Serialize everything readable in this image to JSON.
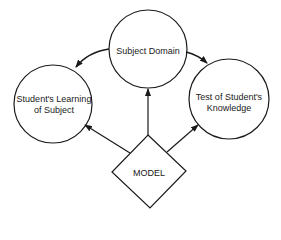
{
  "diagram": {
    "nodes": [
      {
        "id": "subject-domain",
        "shape": "circle",
        "label": "Subject Domain",
        "cx": 148,
        "cy": 49,
        "r": 39
      },
      {
        "id": "students-learning",
        "shape": "circle",
        "label_line1": "Student's Learning",
        "label_line2": "of Subject",
        "cx": 53,
        "cy": 104,
        "r": 39
      },
      {
        "id": "test-knowledge",
        "shape": "circle",
        "label_line1": "Test of Student's",
        "label_line2": "Knowledge",
        "cx": 229,
        "cy": 99,
        "r": 40
      },
      {
        "id": "model",
        "shape": "diamond",
        "label": "MODEL",
        "cx": 149,
        "cy": 171
      }
    ],
    "edges": [
      {
        "from": "subject-domain",
        "to": "students-learning",
        "style": "curved-arrow"
      },
      {
        "from": "subject-domain",
        "to": "test-knowledge",
        "style": "curved-arrow"
      },
      {
        "from": "model",
        "to": "subject-domain",
        "style": "straight-arrow"
      },
      {
        "from": "model",
        "to": "students-learning",
        "style": "straight-arrow"
      },
      {
        "from": "model",
        "to": "test-knowledge",
        "style": "straight-arrow"
      }
    ],
    "stroke_color": "#1a1a1a"
  }
}
